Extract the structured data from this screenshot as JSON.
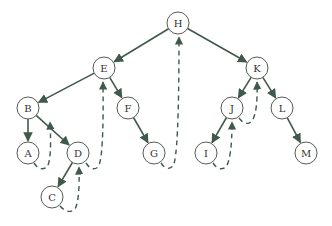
{
  "diagram": {
    "type": "binary-tree-traversal",
    "colors": {
      "edge": "#3f5a4a",
      "node_stroke": "#555a55",
      "text": "#333333",
      "background": "#ffffff"
    },
    "nodes": [
      {
        "id": "H",
        "label": "H",
        "x": 178,
        "y": 23
      },
      {
        "id": "E",
        "label": "E",
        "x": 104,
        "y": 68
      },
      {
        "id": "K",
        "label": "K",
        "x": 257,
        "y": 68
      },
      {
        "id": "B",
        "label": "B",
        "x": 28,
        "y": 108
      },
      {
        "id": "F",
        "label": "F",
        "x": 128,
        "y": 108
      },
      {
        "id": "J",
        "label": "J",
        "x": 232,
        "y": 108
      },
      {
        "id": "L",
        "label": "L",
        "x": 282,
        "y": 108
      },
      {
        "id": "A",
        "label": "A",
        "x": 28,
        "y": 153
      },
      {
        "id": "D",
        "label": "D",
        "x": 78,
        "y": 153
      },
      {
        "id": "G",
        "label": "G",
        "x": 154,
        "y": 153
      },
      {
        "id": "I",
        "label": "I",
        "x": 206,
        "y": 153
      },
      {
        "id": "M",
        "label": "M",
        "x": 306,
        "y": 153
      },
      {
        "id": "C",
        "label": "C",
        "x": 52,
        "y": 197
      }
    ],
    "edges": [
      [
        "H",
        "E"
      ],
      [
        "H",
        "K"
      ],
      [
        "E",
        "B"
      ],
      [
        "E",
        "F"
      ],
      [
        "B",
        "A"
      ],
      [
        "B",
        "D"
      ],
      [
        "D",
        "C"
      ],
      [
        "F",
        "G"
      ],
      [
        "K",
        "J"
      ],
      [
        "K",
        "L"
      ],
      [
        "J",
        "I"
      ],
      [
        "L",
        "M"
      ]
    ],
    "return_paths": [
      {
        "from": "A",
        "to": "B"
      },
      {
        "from": "C",
        "to": "D"
      },
      {
        "from": "D",
        "to": "E"
      },
      {
        "from": "G",
        "to": "H"
      },
      {
        "from": "I",
        "to": "J"
      },
      {
        "from": "J",
        "to": "K"
      }
    ]
  }
}
